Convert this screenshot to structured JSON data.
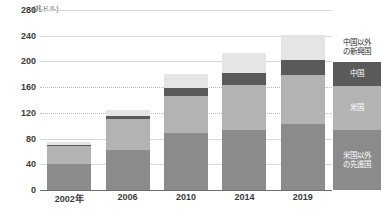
{
  "chart_data": {
    "type": "bar",
    "subtype": "stacked-column",
    "title": "",
    "subtitle": "",
    "unit_caption": "(兆ドル)",
    "xlabel": "",
    "ylabel": "",
    "categories": [
      "2002年",
      "2006",
      "2010",
      "2014",
      "2019"
    ],
    "ylim": [
      0,
      280
    ],
    "yticks": [
      0,
      40,
      80,
      120,
      160,
      200,
      240,
      280
    ],
    "ytick_labels": [
      "0",
      "40",
      "80",
      "120",
      "160",
      "200",
      "240",
      "280"
    ],
    "grid": true,
    "legend_position": "right",
    "series": [
      {
        "name": "米国以外の先進国",
        "legend_label": "米国以外\nの先進国",
        "color": "#8b8b8b",
        "values": [
          40,
          63,
          88,
          94,
          103
        ]
      },
      {
        "name": "米国",
        "legend_label": "米国",
        "color": "#b3b3b3",
        "values": [
          28,
          48,
          59,
          70,
          76
        ]
      },
      {
        "name": "中国",
        "legend_label": "中国",
        "color": "#5a5a5a",
        "values": [
          2,
          4,
          12,
          18,
          23
        ]
      },
      {
        "name": "中国以外の新興国",
        "legend_label": "中国以外\nの新興国",
        "color": "#e5e5e5",
        "values": [
          4,
          9,
          21,
          31,
          39
        ]
      }
    ],
    "totals": [
      74,
      124,
      180,
      213,
      241
    ]
  },
  "legend": {
    "items": [
      {
        "label": "中国以外\nの新興国",
        "color": "#ffffff",
        "text_color": "#2e2e2e"
      },
      {
        "label": "中国",
        "color": "#5a5a5a",
        "text_color": "#ffffff"
      },
      {
        "label": "米国",
        "color": "#b3b3b3",
        "text_color": "#ffffff"
      },
      {
        "label": "米国以外\nの先進国",
        "color": "#8b8b8b",
        "text_color": "#ffffff"
      }
    ]
  },
  "colors": {
    "background": "#ffffff",
    "gridline": "#d8d8d8",
    "axis": "#6d6d6d",
    "tick_text": "#3b3b3b"
  }
}
